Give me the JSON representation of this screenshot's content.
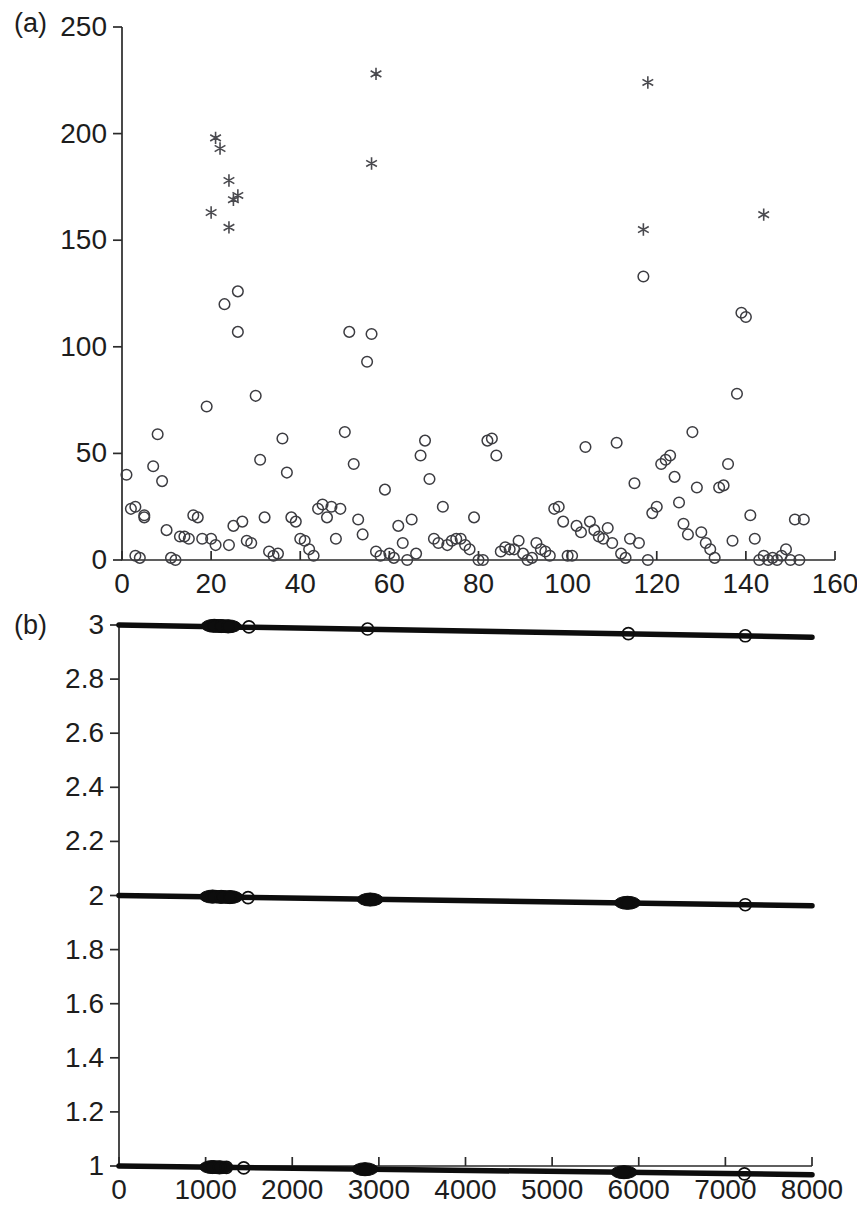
{
  "figure": {
    "panels": [
      {
        "id": "a",
        "label": "(a)",
        "name": "panel-a-scatter"
      },
      {
        "id": "b",
        "label": "(b)",
        "name": "panel-b-bands"
      }
    ]
  },
  "chart_data": [
    {
      "type": "scatter",
      "panel": "a",
      "title": "",
      "xlabel": "",
      "ylabel": "",
      "xlim": [
        0,
        160
      ],
      "ylim": [
        0,
        250
      ],
      "xticks": [
        0,
        20,
        40,
        60,
        80,
        100,
        120,
        140,
        160
      ],
      "xticklabels": [
        "0",
        "20",
        "40",
        "60",
        "80",
        "100",
        "120",
        "140",
        "160"
      ],
      "yticks": [
        0,
        50,
        100,
        150,
        200,
        250
      ],
      "yticklabels": [
        "0",
        "50",
        "100",
        "150",
        "200",
        "250"
      ],
      "grid": false,
      "legend": null,
      "series": [
        {
          "name": "circles",
          "marker": "open-circle",
          "color": "#3c3c41",
          "points": [
            [
              1,
              40
            ],
            [
              2,
              24
            ],
            [
              3,
              25
            ],
            [
              3,
              2
            ],
            [
              4,
              1
            ],
            [
              5,
              20
            ],
            [
              5,
              21
            ],
            [
              7,
              44
            ],
            [
              8,
              59
            ],
            [
              9,
              37
            ],
            [
              10,
              14
            ],
            [
              11,
              1
            ],
            [
              12,
              0
            ],
            [
              13,
              11
            ],
            [
              14,
              11
            ],
            [
              15,
              10
            ],
            [
              16,
              21
            ],
            [
              17,
              20
            ],
            [
              18,
              10
            ],
            [
              19,
              72
            ],
            [
              20,
              10
            ],
            [
              21,
              7
            ],
            [
              23,
              120
            ],
            [
              24,
              7
            ],
            [
              25,
              16
            ],
            [
              26,
              126
            ],
            [
              26,
              107
            ],
            [
              27,
              18
            ],
            [
              28,
              9
            ],
            [
              29,
              8
            ],
            [
              30,
              77
            ],
            [
              31,
              47
            ],
            [
              32,
              20
            ],
            [
              33,
              4
            ],
            [
              34,
              2
            ],
            [
              35,
              3
            ],
            [
              36,
              57
            ],
            [
              37,
              41
            ],
            [
              38,
              20
            ],
            [
              39,
              18
            ],
            [
              40,
              10
            ],
            [
              41,
              9
            ],
            [
              42,
              5
            ],
            [
              43,
              2
            ],
            [
              44,
              24
            ],
            [
              45,
              26
            ],
            [
              46,
              20
            ],
            [
              47,
              25
            ],
            [
              48,
              10
            ],
            [
              49,
              24
            ],
            [
              50,
              60
            ],
            [
              51,
              107
            ],
            [
              52,
              45
            ],
            [
              53,
              19
            ],
            [
              54,
              12
            ],
            [
              55,
              93
            ],
            [
              56,
              106
            ],
            [
              57,
              4
            ],
            [
              58,
              2
            ],
            [
              59,
              33
            ],
            [
              60,
              3
            ],
            [
              61,
              1
            ],
            [
              62,
              16
            ],
            [
              63,
              8
            ],
            [
              64,
              0
            ],
            [
              65,
              19
            ],
            [
              66,
              3
            ],
            [
              67,
              49
            ],
            [
              68,
              56
            ],
            [
              69,
              38
            ],
            [
              70,
              10
            ],
            [
              71,
              8
            ],
            [
              72,
              25
            ],
            [
              73,
              7
            ],
            [
              74,
              9
            ],
            [
              75,
              10
            ],
            [
              76,
              10
            ],
            [
              77,
              7
            ],
            [
              78,
              5
            ],
            [
              79,
              20
            ],
            [
              80,
              0
            ],
            [
              81,
              0
            ],
            [
              82,
              56
            ],
            [
              83,
              57
            ],
            [
              84,
              49
            ],
            [
              85,
              4
            ],
            [
              86,
              6
            ],
            [
              87,
              5
            ],
            [
              88,
              5
            ],
            [
              89,
              9
            ],
            [
              90,
              3
            ],
            [
              91,
              0
            ],
            [
              92,
              1
            ],
            [
              93,
              8
            ],
            [
              94,
              5
            ],
            [
              95,
              4
            ],
            [
              96,
              2
            ],
            [
              97,
              24
            ],
            [
              98,
              25
            ],
            [
              99,
              18
            ],
            [
              100,
              2
            ],
            [
              101,
              2
            ],
            [
              102,
              16
            ],
            [
              103,
              13
            ],
            [
              104,
              53
            ],
            [
              105,
              18
            ],
            [
              106,
              14
            ],
            [
              107,
              11
            ],
            [
              108,
              10
            ],
            [
              109,
              15
            ],
            [
              110,
              8
            ],
            [
              111,
              55
            ],
            [
              112,
              3
            ],
            [
              113,
              1
            ],
            [
              114,
              10
            ],
            [
              115,
              36
            ],
            [
              116,
              8
            ],
            [
              117,
              133
            ],
            [
              118,
              0
            ],
            [
              119,
              22
            ],
            [
              120,
              25
            ],
            [
              121,
              45
            ],
            [
              122,
              47
            ],
            [
              123,
              49
            ],
            [
              124,
              39
            ],
            [
              125,
              27
            ],
            [
              126,
              17
            ],
            [
              127,
              12
            ],
            [
              128,
              60
            ],
            [
              129,
              34
            ],
            [
              130,
              13
            ],
            [
              131,
              8
            ],
            [
              132,
              5
            ],
            [
              133,
              1
            ],
            [
              134,
              34
            ],
            [
              135,
              35
            ],
            [
              136,
              45
            ],
            [
              137,
              9
            ],
            [
              138,
              78
            ],
            [
              139,
              116
            ],
            [
              140,
              114
            ],
            [
              141,
              21
            ],
            [
              142,
              10
            ],
            [
              143,
              0
            ],
            [
              144,
              2
            ],
            [
              145,
              0
            ],
            [
              146,
              1
            ],
            [
              147,
              0
            ],
            [
              148,
              2
            ],
            [
              149,
              5
            ],
            [
              150,
              0
            ],
            [
              151,
              19
            ],
            [
              152,
              0
            ],
            [
              153,
              19
            ]
          ]
        },
        {
          "name": "stars",
          "marker": "asterisk",
          "color": "#4a4a4f",
          "points": [
            [
              21,
              198
            ],
            [
              22,
              193
            ],
            [
              24,
              178
            ],
            [
              25,
              169
            ],
            [
              26,
              171
            ],
            [
              20,
              163
            ],
            [
              24,
              156
            ],
            [
              57,
              228
            ],
            [
              56,
              186
            ],
            [
              118,
              224
            ],
            [
              117,
              155
            ],
            [
              144,
              162
            ]
          ]
        }
      ]
    },
    {
      "type": "line",
      "panel": "b",
      "title": "",
      "xlabel": "",
      "ylabel": "",
      "xlim": [
        0,
        8000
      ],
      "ylim": [
        1,
        3
      ],
      "xticks": [
        0,
        1000,
        2000,
        3000,
        4000,
        5000,
        6000,
        7000,
        8000
      ],
      "xticklabels": [
        "0",
        "1000",
        "2000",
        "3000",
        "4000",
        "5000",
        "6000",
        "7000",
        "8000"
      ],
      "yticks": [
        1,
        1.2,
        1.4,
        1.6,
        1.8,
        2,
        2.2,
        2.4,
        2.6,
        2.8,
        3
      ],
      "yticklabels": [
        "1",
        "1.2",
        "1.4",
        "1.6",
        "1.8",
        "2",
        "2.2",
        "2.4",
        "2.6",
        "2.8",
        "3"
      ],
      "grid": false,
      "legend": null,
      "series": [
        {
          "name": "band-3",
          "level": 3,
          "color": "#0d0d0d",
          "x": [
            0,
            8000
          ],
          "y": [
            3.0,
            2.955
          ],
          "markers": [
            {
              "x": 1100,
              "y": 2.997,
              "size": "cluster"
            },
            {
              "x": 1180,
              "y": 2.996,
              "size": "cluster"
            },
            {
              "x": 1260,
              "y": 2.995,
              "size": "cluster"
            },
            {
              "x": 1500,
              "y": 2.993,
              "size": "single"
            },
            {
              "x": 2870,
              "y": 2.985,
              "size": "single"
            },
            {
              "x": 5880,
              "y": 2.968,
              "size": "single"
            },
            {
              "x": 7230,
              "y": 2.96,
              "size": "single"
            }
          ]
        },
        {
          "name": "band-2",
          "level": 2,
          "color": "#0d0d0d",
          "x": [
            0,
            8000
          ],
          "y": [
            2.0,
            1.962
          ],
          "markers": [
            {
              "x": 1080,
              "y": 1.996,
              "size": "cluster"
            },
            {
              "x": 1180,
              "y": 1.995,
              "size": "cluster"
            },
            {
              "x": 1280,
              "y": 1.994,
              "size": "cluster"
            },
            {
              "x": 1490,
              "y": 1.992,
              "size": "single"
            },
            {
              "x": 2900,
              "y": 1.985,
              "size": "cluster"
            },
            {
              "x": 5870,
              "y": 1.973,
              "size": "cluster"
            },
            {
              "x": 7230,
              "y": 1.966,
              "size": "single"
            }
          ]
        },
        {
          "name": "band-1",
          "level": 1,
          "color": "#0d0d0d",
          "x": [
            0,
            8000
          ],
          "y": [
            1.0,
            0.968
          ],
          "markers": [
            {
              "x": 1080,
              "y": 0.996,
              "size": "cluster"
            },
            {
              "x": 1160,
              "y": 0.995,
              "size": "cluster"
            },
            {
              "x": 1240,
              "y": 0.995,
              "size": "single"
            },
            {
              "x": 1440,
              "y": 0.993,
              "size": "single"
            },
            {
              "x": 2840,
              "y": 0.988,
              "size": "cluster"
            },
            {
              "x": 5830,
              "y": 0.977,
              "size": "cluster"
            },
            {
              "x": 7220,
              "y": 0.971,
              "size": "single"
            }
          ]
        }
      ]
    }
  ]
}
